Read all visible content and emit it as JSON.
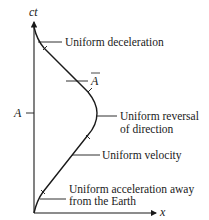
{
  "diagram": {
    "axes": {
      "vertical_label": "ct",
      "horizontal_label": "x"
    },
    "markers": {
      "event_A": "A",
      "event_A_bar": "Ā"
    },
    "annotations": [
      {
        "id": "deceleration",
        "lines": [
          "Uniform deceleration"
        ]
      },
      {
        "id": "reversal",
        "lines": [
          "Uniform reversal",
          "of direction"
        ]
      },
      {
        "id": "velocity",
        "lines": [
          "Uniform velocity"
        ]
      },
      {
        "id": "acceleration",
        "lines": [
          "Uniform acceleration away",
          "from the Earth"
        ]
      }
    ],
    "colors": {
      "ink": "#1a1a1a",
      "background": "#ffffff"
    }
  }
}
